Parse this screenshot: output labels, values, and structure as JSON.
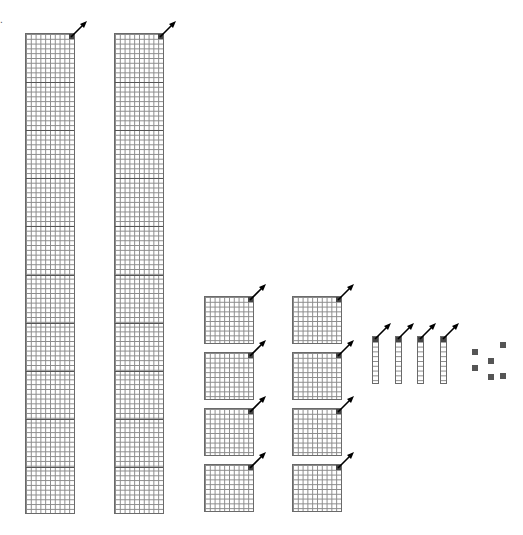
{
  "dot_mark": ".",
  "blocks": {
    "thousands_columns": [
      {
        "x": 25,
        "y": 33,
        "width": 50,
        "height": 481,
        "sections": 10
      },
      {
        "x": 114,
        "y": 33,
        "width": 50,
        "height": 481,
        "sections": 10
      }
    ],
    "hundreds_flats": [
      {
        "x": 204,
        "y": 296
      },
      {
        "x": 204,
        "y": 352
      },
      {
        "x": 204,
        "y": 408
      },
      {
        "x": 204,
        "y": 464
      },
      {
        "x": 292,
        "y": 296
      },
      {
        "x": 292,
        "y": 352
      },
      {
        "x": 292,
        "y": 408
      },
      {
        "x": 292,
        "y": 464
      }
    ],
    "tens_rods": [
      {
        "x": 372,
        "y": 336
      },
      {
        "x": 395,
        "y": 336
      },
      {
        "x": 417,
        "y": 336
      },
      {
        "x": 440,
        "y": 336
      }
    ],
    "ones_units": [
      {
        "x": 472,
        "y": 349
      },
      {
        "x": 472,
        "y": 365
      },
      {
        "x": 488,
        "y": 358
      },
      {
        "x": 488,
        "y": 374
      },
      {
        "x": 500,
        "y": 342
      },
      {
        "x": 500,
        "y": 373
      }
    ]
  },
  "counts": {
    "columns": 2,
    "flats": 8,
    "rods": 4,
    "units": 6
  },
  "colors": {
    "grid_line": "#8a8a8a",
    "border": "#6a6a6a",
    "marker": "#444444",
    "arrow": "#000000"
  }
}
